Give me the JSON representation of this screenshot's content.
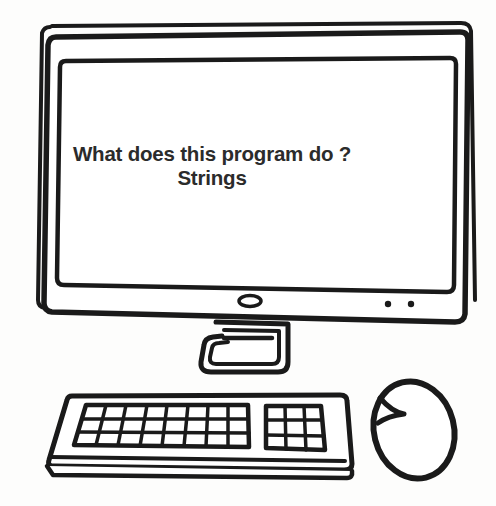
{
  "illustration": {
    "style": "hand-drawn black line art, coloring-book style",
    "subject": "desktop computer with monitor, stand, keyboard and mouse",
    "background_color": "#fdfdfc",
    "stroke_color": "#1a1a1a"
  },
  "monitor": {
    "name": "computer monitor",
    "screen": {
      "text_line_1": "What does this program do ?",
      "text_line_2": "Strings",
      "text_color": "#2b2b2b",
      "background_color": "#ffffff"
    },
    "bezel": {
      "power_button": "oval power button",
      "indicator_lights": 2
    }
  },
  "stand": {
    "name": "monitor stand",
    "detail": "trapezoidal neck with horizontal slot line"
  },
  "keyboard": {
    "name": "keyboard",
    "main_keys": {
      "columns": 8,
      "rows": 3
    },
    "numpad_keys": {
      "columns": 3,
      "rows": 3
    }
  },
  "mouse": {
    "name": "computer mouse",
    "detail": "oval body with left button split line"
  }
}
